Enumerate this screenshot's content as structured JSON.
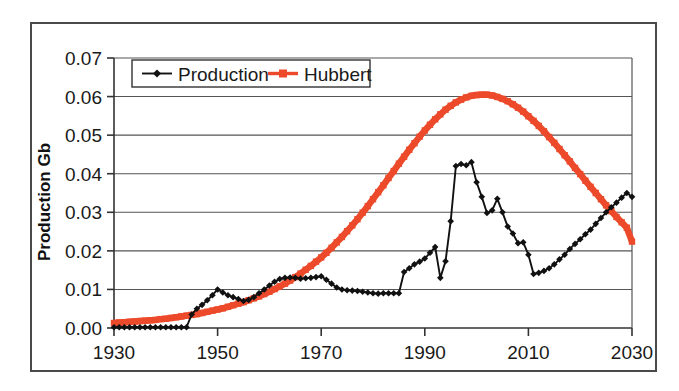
{
  "chart_data": {
    "type": "line",
    "title": "",
    "xlabel": "",
    "ylabel": "Production Gb",
    "xlim": [
      1930,
      2030
    ],
    "ylim": [
      0.0,
      0.07
    ],
    "xticks": [
      1930,
      1950,
      1970,
      1990,
      2010,
      2030
    ],
    "yticks": [
      "0.00",
      "0.01",
      "0.02",
      "0.03",
      "0.04",
      "0.05",
      "0.06",
      "0.07"
    ],
    "ytick_values": [
      0.0,
      0.01,
      0.02,
      0.03,
      0.04,
      0.05,
      0.06,
      0.07
    ],
    "grid": "horizontal",
    "legend_position": "top-left-inside",
    "series": [
      {
        "name": "Production",
        "color": "#111111",
        "marker": "diamond",
        "x": [
          1930,
          1931,
          1932,
          1933,
          1934,
          1935,
          1936,
          1937,
          1938,
          1939,
          1940,
          1941,
          1942,
          1943,
          1944,
          1945,
          1946,
          1947,
          1948,
          1949,
          1950,
          1951,
          1952,
          1953,
          1954,
          1955,
          1956,
          1957,
          1958,
          1959,
          1960,
          1961,
          1962,
          1963,
          1964,
          1965,
          1966,
          1967,
          1968,
          1969,
          1970,
          1971,
          1972,
          1973,
          1974,
          1975,
          1976,
          1977,
          1978,
          1979,
          1980,
          1981,
          1982,
          1983,
          1984,
          1985,
          1986,
          1987,
          1988,
          1989,
          1990,
          1991,
          1992,
          1993,
          1994,
          1995,
          1996,
          1997,
          1998,
          1999,
          2000,
          2001,
          2002,
          2003,
          2004,
          2005,
          2006,
          2007,
          2008,
          2009,
          2010,
          2011,
          2012,
          2013,
          2014,
          2015,
          2016,
          2017,
          2018,
          2019,
          2020,
          2021,
          2022,
          2023,
          2024,
          2025,
          2026,
          2027,
          2028,
          2029,
          2030
        ],
        "y": [
          0.0002,
          0.0002,
          0.0002,
          0.0002,
          0.0002,
          0.0002,
          0.0002,
          0.0002,
          0.0002,
          0.0002,
          0.0002,
          0.0002,
          0.0002,
          0.0002,
          0.0002,
          0.0035,
          0.005,
          0.006,
          0.0072,
          0.0085,
          0.01,
          0.0092,
          0.0085,
          0.008,
          0.0075,
          0.007,
          0.0073,
          0.008,
          0.009,
          0.01,
          0.011,
          0.012,
          0.0127,
          0.013,
          0.0131,
          0.013,
          0.0128,
          0.0129,
          0.013,
          0.0132,
          0.0134,
          0.0125,
          0.0115,
          0.0105,
          0.01,
          0.0098,
          0.0097,
          0.0096,
          0.0094,
          0.0092,
          0.009,
          0.0089,
          0.009,
          0.009,
          0.009,
          0.009,
          0.0145,
          0.0155,
          0.0165,
          0.0172,
          0.018,
          0.0195,
          0.021,
          0.013,
          0.0173,
          0.0277,
          0.042,
          0.0425,
          0.0422,
          0.043,
          0.0378,
          0.034,
          0.0298,
          0.0305,
          0.0335,
          0.03,
          0.0263,
          0.0245,
          0.022,
          0.0222,
          0.019,
          0.014,
          0.0143,
          0.0148,
          0.0155,
          0.0165,
          0.0178,
          0.019,
          0.0205,
          0.0218,
          0.023,
          0.0243,
          0.0255,
          0.027,
          0.0285,
          0.03,
          0.0313,
          0.0325,
          0.0338,
          0.035,
          0.034
        ]
      },
      {
        "name": "Hubbert",
        "color": "#EC4A2B",
        "marker": "square",
        "x": [
          1930,
          1931,
          1932,
          1933,
          1934,
          1935,
          1936,
          1937,
          1938,
          1939,
          1940,
          1941,
          1942,
          1943,
          1944,
          1945,
          1946,
          1947,
          1948,
          1949,
          1950,
          1951,
          1952,
          1953,
          1954,
          1955,
          1956,
          1957,
          1958,
          1959,
          1960,
          1961,
          1962,
          1963,
          1964,
          1965,
          1966,
          1967,
          1968,
          1969,
          1970,
          1971,
          1972,
          1973,
          1974,
          1975,
          1976,
          1977,
          1978,
          1979,
          1980,
          1981,
          1982,
          1983,
          1984,
          1985,
          1986,
          1987,
          1988,
          1989,
          1990,
          1991,
          1992,
          1993,
          1994,
          1995,
          1996,
          1997,
          1998,
          1999,
          2000,
          2001,
          2002,
          2003,
          2004,
          2005,
          2006,
          2007,
          2008,
          2009,
          2010,
          2011,
          2012,
          2013,
          2014,
          2015,
          2016,
          2017,
          2018,
          2019,
          2020,
          2021,
          2022,
          2023,
          2024,
          2025,
          2026,
          2027,
          2028,
          2029,
          2030
        ],
        "y": [
          0.0013,
          0.0014,
          0.0015,
          0.0016,
          0.0017,
          0.0018,
          0.0019,
          0.002,
          0.0021,
          0.0023,
          0.0024,
          0.0026,
          0.0028,
          0.003,
          0.0032,
          0.0034,
          0.0036,
          0.0039,
          0.0042,
          0.0045,
          0.0048,
          0.0051,
          0.0055,
          0.0059,
          0.0063,
          0.0067,
          0.0072,
          0.0077,
          0.0082,
          0.0088,
          0.0094,
          0.0101,
          0.0108,
          0.0115,
          0.0123,
          0.0132,
          0.0141,
          0.0151,
          0.0161,
          0.0172,
          0.0183,
          0.0195,
          0.0208,
          0.0222,
          0.0236,
          0.0251,
          0.0266,
          0.0282,
          0.0299,
          0.0316,
          0.0334,
          0.0352,
          0.037,
          0.0389,
          0.0407,
          0.0426,
          0.0444,
          0.0462,
          0.0479,
          0.0496,
          0.0512,
          0.0527,
          0.0541,
          0.0554,
          0.0566,
          0.0576,
          0.0585,
          0.0592,
          0.0598,
          0.0602,
          0.0604,
          0.0605,
          0.0605,
          0.0603,
          0.0599,
          0.0594,
          0.0588,
          0.058,
          0.0571,
          0.0561,
          0.0549,
          0.0537,
          0.0524,
          0.051,
          0.0495,
          0.048,
          0.0464,
          0.0448,
          0.0432,
          0.0415,
          0.0399,
          0.0382,
          0.0366,
          0.035,
          0.0334,
          0.0318,
          0.0303,
          0.0288,
          0.0274,
          0.026,
          0.0224
        ]
      }
    ],
    "legend": [
      {
        "label": "Production",
        "color": "#111111",
        "marker": "diamond"
      },
      {
        "label": "Hubbert",
        "color": "#EC4A2B",
        "marker": "square"
      }
    ]
  },
  "colors": {
    "production": "#111111",
    "hubbert": "#EC4A2B",
    "grid": "#555555",
    "axis": "#333333",
    "frame": "#4a4a4a",
    "background": "#ffffff"
  }
}
